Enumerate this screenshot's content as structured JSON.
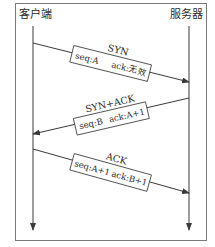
{
  "diagram": {
    "participants": {
      "client": "客户端",
      "server": "服务器"
    },
    "messages": [
      {
        "name": "SYN",
        "direction": "client-to-server",
        "seq": "seq:A",
        "ack": "ack:无效"
      },
      {
        "name": "SYN+ACK",
        "direction": "server-to-client",
        "seq": "seq:B",
        "ack": "ack:A+1"
      },
      {
        "name": "ACK",
        "direction": "client-to-server",
        "seq": "seq:A+1",
        "ack": "ack:B+1"
      }
    ],
    "colors": {
      "line": "#3a3a3a",
      "frame": "#7a7a7a",
      "background": "#ffffff"
    }
  }
}
